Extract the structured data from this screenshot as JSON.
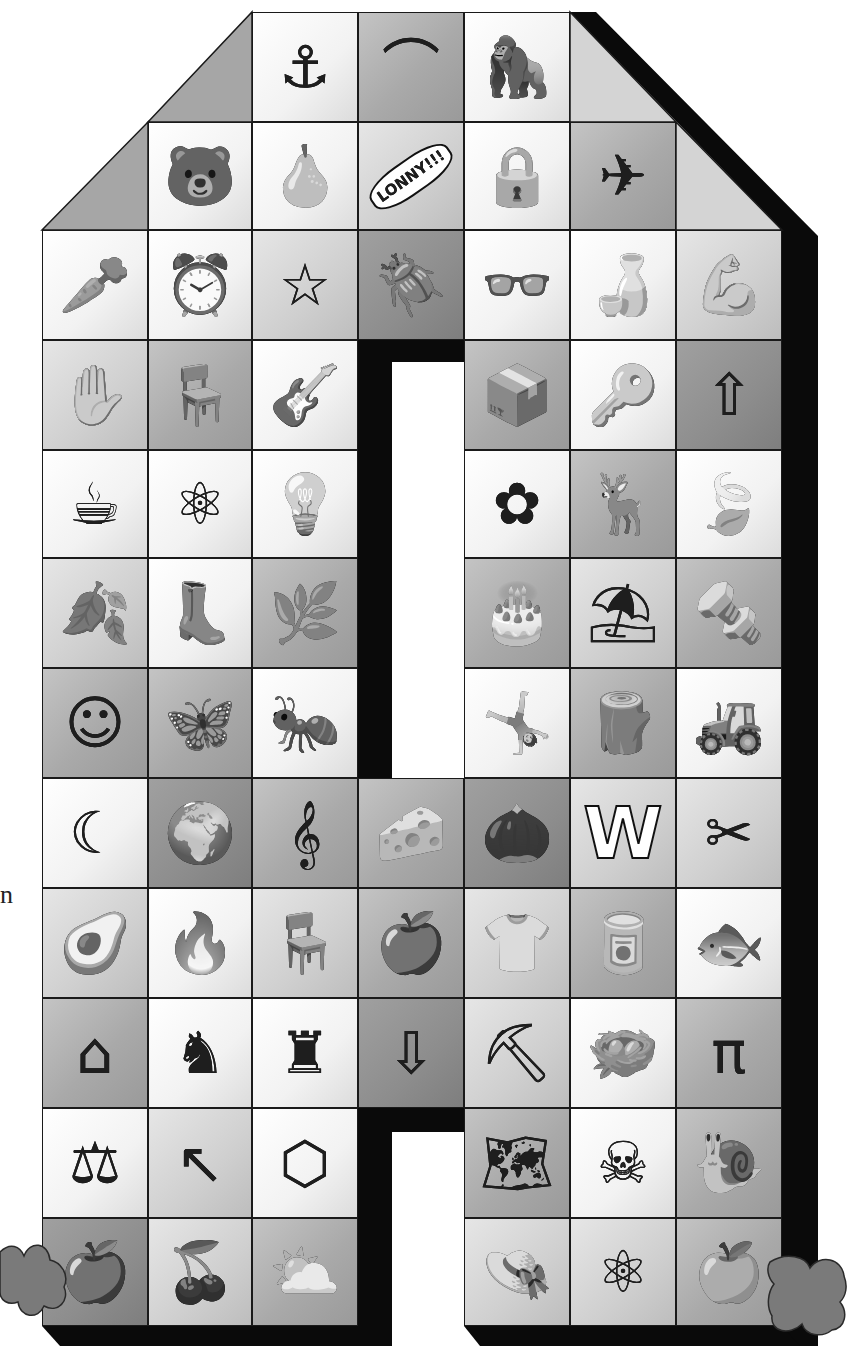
{
  "illustration": {
    "subject": "Letter A made of picture tiles",
    "stray_character": "n",
    "colors": {
      "outline": "#1a1a1a",
      "shadow": "#0a0a0a",
      "tile_white": "#f4f4f4",
      "tile_light": "#d0d0d0",
      "tile_mid": "#a8a8a8",
      "tile_dark": "#8c8c8c",
      "feet": "#7a7a7a"
    },
    "brush_inscription": "LONNY!!!"
  },
  "rows": [
    {
      "row": 1,
      "tiles": [
        {
          "col": 3,
          "name": "anchor",
          "glyph": "⚓",
          "tone": "w"
        },
        {
          "col": 4,
          "name": "brick-arch",
          "glyph": "⌒",
          "tone": "m"
        },
        {
          "col": 5,
          "name": "gorilla",
          "glyph": "🦍",
          "tone": "w"
        }
      ]
    },
    {
      "row": 2,
      "tiles": [
        {
          "col": 2,
          "name": "bear",
          "glyph": "🐻",
          "tone": "w"
        },
        {
          "col": 3,
          "name": "pear",
          "glyph": "🍐",
          "tone": "w"
        },
        {
          "col": 4,
          "name": "hairbrush",
          "glyph": "LONNY!!!",
          "tone": "l"
        },
        {
          "col": 5,
          "name": "padlock",
          "glyph": "🔒",
          "tone": "w"
        },
        {
          "col": 6,
          "name": "airplane",
          "glyph": "✈",
          "tone": "m"
        }
      ]
    },
    {
      "row": 3,
      "tiles": [
        {
          "col": 1,
          "name": "beetroot",
          "glyph": "🥕",
          "tone": "w"
        },
        {
          "col": 2,
          "name": "alarm-clock",
          "glyph": "⏰",
          "tone": "w"
        },
        {
          "col": 3,
          "name": "star",
          "glyph": "☆",
          "tone": "l"
        },
        {
          "col": 4,
          "name": "beetle",
          "glyph": "🪲",
          "tone": "d"
        },
        {
          "col": 5,
          "name": "spectacles",
          "glyph": "👓",
          "tone": "w"
        },
        {
          "col": 6,
          "name": "bottle",
          "glyph": "🍶",
          "tone": "w"
        },
        {
          "col": 7,
          "name": "arm-flexing",
          "glyph": "💪",
          "tone": "l"
        }
      ]
    },
    {
      "row": 4,
      "tiles": [
        {
          "col": 1,
          "name": "glove",
          "glyph": "✋",
          "tone": "l"
        },
        {
          "col": 2,
          "name": "armchair",
          "glyph": "🪑",
          "tone": "m"
        },
        {
          "col": 3,
          "name": "guitar",
          "glyph": "🎸",
          "tone": "w"
        },
        {
          "col": 5,
          "name": "box",
          "glyph": "📦",
          "tone": "m"
        },
        {
          "col": 6,
          "name": "key",
          "glyph": "🔑",
          "tone": "w"
        },
        {
          "col": 7,
          "name": "arrow-outline",
          "glyph": "⇧",
          "tone": "d"
        }
      ]
    },
    {
      "row": 5,
      "tiles": [
        {
          "col": 1,
          "name": "kettle",
          "glyph": "☕",
          "tone": "w"
        },
        {
          "col": 2,
          "name": "atom",
          "glyph": "⚛",
          "tone": "w"
        },
        {
          "col": 3,
          "name": "lamp",
          "glyph": "💡",
          "tone": "w"
        },
        {
          "col": 5,
          "name": "flower",
          "glyph": "✿",
          "tone": "w"
        },
        {
          "col": 6,
          "name": "antlers",
          "glyph": "🦌",
          "tone": "m"
        },
        {
          "col": 7,
          "name": "holly-leaf",
          "glyph": "🍃",
          "tone": "w"
        }
      ]
    },
    {
      "row": 6,
      "tiles": [
        {
          "col": 1,
          "name": "oak-leaf",
          "glyph": "🍂",
          "tone": "l"
        },
        {
          "col": 2,
          "name": "boot",
          "glyph": "👢",
          "tone": "w"
        },
        {
          "col": 3,
          "name": "asparagus",
          "glyph": "🌿",
          "tone": "m"
        },
        {
          "col": 5,
          "name": "cake",
          "glyph": "🎂",
          "tone": "m"
        },
        {
          "col": 6,
          "name": "awning",
          "glyph": "⛱",
          "tone": "l"
        },
        {
          "col": 7,
          "name": "screw",
          "glyph": "🔩",
          "tone": "m"
        }
      ]
    },
    {
      "row": 7,
      "tiles": [
        {
          "col": 1,
          "name": "smiley-face",
          "glyph": "☺",
          "tone": "m"
        },
        {
          "col": 2,
          "name": "butterfly",
          "glyph": "🦋",
          "tone": "m"
        },
        {
          "col": 3,
          "name": "ant",
          "glyph": "🐜",
          "tone": "w"
        },
        {
          "col": 5,
          "name": "acrobat",
          "glyph": "🤸",
          "tone": "w"
        },
        {
          "col": 6,
          "name": "tree-stump",
          "glyph": "🪵",
          "tone": "m"
        },
        {
          "col": 7,
          "name": "tractor",
          "glyph": "🚜",
          "tone": "w"
        }
      ]
    },
    {
      "row": 8,
      "tiles": [
        {
          "col": 1,
          "name": "crescent-moon",
          "glyph": "☾",
          "tone": "w"
        },
        {
          "col": 2,
          "name": "africa-map",
          "glyph": "🌍",
          "tone": "d"
        },
        {
          "col": 3,
          "name": "treble-clef",
          "glyph": "𝄞",
          "tone": "m"
        },
        {
          "col": 4,
          "name": "cheese",
          "glyph": "🧀",
          "tone": "m"
        },
        {
          "col": 5,
          "name": "acorn",
          "glyph": "🌰",
          "tone": "d"
        },
        {
          "col": 6,
          "name": "letter-w",
          "glyph": "W",
          "tone": "l"
        },
        {
          "col": 7,
          "name": "pincers",
          "glyph": "✂",
          "tone": "l"
        }
      ]
    },
    {
      "row": 9,
      "tiles": [
        {
          "col": 1,
          "name": "avocado",
          "glyph": "🥑",
          "tone": "l"
        },
        {
          "col": 2,
          "name": "match",
          "glyph": "🔥",
          "tone": "w"
        },
        {
          "col": 3,
          "name": "chair",
          "glyph": "🪑",
          "tone": "l"
        },
        {
          "col": 4,
          "name": "apple",
          "glyph": "🍎",
          "tone": "m"
        },
        {
          "col": 5,
          "name": "t-shirt",
          "glyph": "👕",
          "tone": "l"
        },
        {
          "col": 6,
          "name": "paint-pot",
          "glyph": "🥫",
          "tone": "m"
        },
        {
          "col": 7,
          "name": "fish",
          "glyph": "🐟",
          "tone": "w"
        }
      ]
    },
    {
      "row": 10,
      "tiles": [
        {
          "col": 1,
          "name": "house",
          "glyph": "⌂",
          "tone": "m"
        },
        {
          "col": 2,
          "name": "knight",
          "glyph": "♞",
          "tone": "w"
        },
        {
          "col": 3,
          "name": "castle-tower",
          "glyph": "♜",
          "tone": "w"
        },
        {
          "col": 4,
          "name": "arrow-outline",
          "glyph": "⇩",
          "tone": "d"
        },
        {
          "col": 5,
          "name": "spade",
          "glyph": "⛏",
          "tone": "l"
        },
        {
          "col": 6,
          "name": "nest-with-eggs",
          "glyph": "🪺",
          "tone": "w"
        },
        {
          "col": 7,
          "name": "table",
          "glyph": "π",
          "tone": "m"
        }
      ]
    },
    {
      "row": 11,
      "tiles": [
        {
          "col": 1,
          "name": "scales",
          "glyph": "⚖",
          "tone": "w"
        },
        {
          "col": 2,
          "name": "arrow",
          "glyph": "↖",
          "tone": "l"
        },
        {
          "col": 3,
          "name": "nut",
          "glyph": "⬡",
          "tone": "w"
        },
        {
          "col": 5,
          "name": "australia-map",
          "glyph": "🗺",
          "tone": "m"
        },
        {
          "col": 6,
          "name": "crossbones",
          "glyph": "☠",
          "tone": "w"
        },
        {
          "col": 7,
          "name": "snail",
          "glyph": "🐌",
          "tone": "m"
        }
      ]
    },
    {
      "row": 12,
      "tiles": [
        {
          "col": 1,
          "name": "apple",
          "glyph": "🍎",
          "tone": "d"
        },
        {
          "col": 2,
          "name": "cherries",
          "glyph": "🍒",
          "tone": "l"
        },
        {
          "col": 3,
          "name": "cloud-sun",
          "glyph": "⛅",
          "tone": "m"
        },
        {
          "col": 5,
          "name": "hat",
          "glyph": "👒",
          "tone": "l"
        },
        {
          "col": 6,
          "name": "atom",
          "glyph": "⚛",
          "tone": "l"
        },
        {
          "col": 7,
          "name": "apple",
          "glyph": "🍏",
          "tone": "m"
        }
      ]
    }
  ]
}
